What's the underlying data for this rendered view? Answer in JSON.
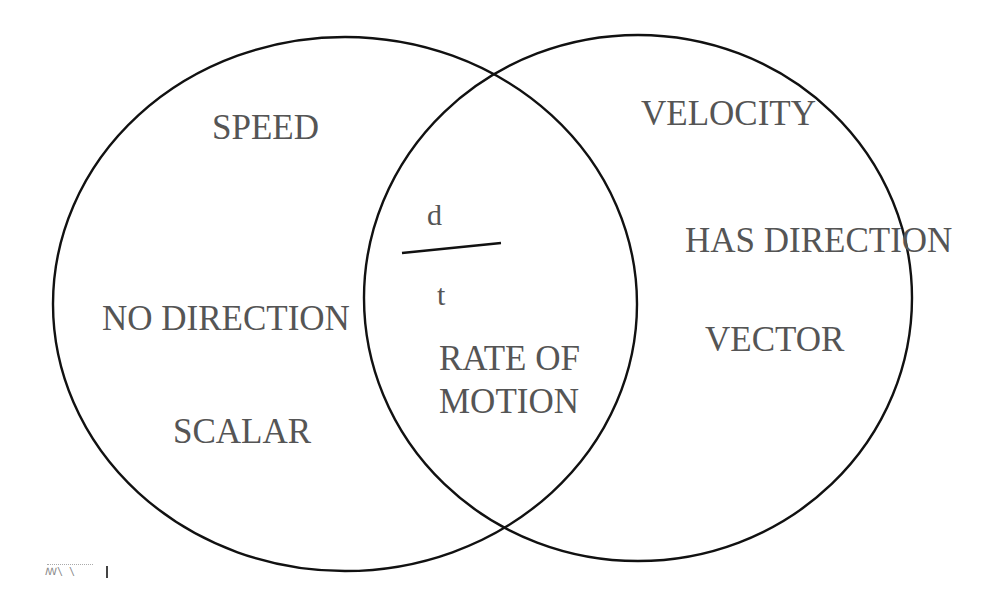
{
  "diagram": {
    "type": "venn",
    "colors": {
      "outline": "#111111",
      "text": "#555555",
      "background": "#ffffff"
    },
    "sets": [
      {
        "name": "SPEED",
        "side": "left",
        "unique_items": [
          "NO DIRECTION",
          "SCALAR"
        ]
      },
      {
        "name": "VELOCITY",
        "side": "right",
        "unique_items": [
          "HAS DIRECTION",
          "VECTOR"
        ]
      }
    ],
    "intersection": {
      "formula": {
        "numerator": "d",
        "denominator": "t"
      },
      "items": [
        "RATE OF",
        "MOTION"
      ]
    },
    "labels": {
      "left_title": "SPEED",
      "left_item_1": "NO DIRECTION",
      "left_item_2": "SCALAR",
      "right_title": "VELOCITY",
      "right_item_1": "HAS DIRECTION",
      "right_item_2": "VECTOR",
      "center_numerator": "d",
      "center_denominator": "t",
      "center_line_1": "RATE OF",
      "center_line_2": "MOTION"
    },
    "footer_artifact": "ꟿ\\ \\"
  }
}
